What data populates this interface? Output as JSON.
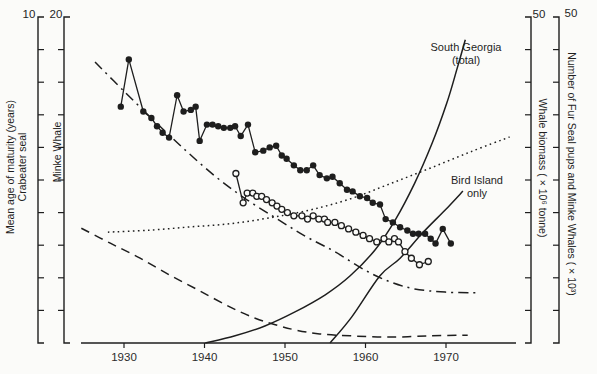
{
  "figure": {
    "ink": "#1e1e1e",
    "background": "#fbfbf9",
    "tick_text_color": "#2b2b2b"
  },
  "axes": {
    "x": {
      "tick_labels": [
        "1930",
        "1940",
        "1950",
        "1960",
        "1970"
      ],
      "tick_years": [
        1930,
        1940,
        1950,
        1960,
        1970
      ]
    },
    "left_crabeater": {
      "top_label": "10",
      "range": [
        0,
        10
      ],
      "label_line1": "Mean age of maturity (years)",
      "label_line2": "Crabeater seal"
    },
    "left_minke": {
      "top_label": "20",
      "range": [
        0,
        20
      ],
      "label": "Minke Whale"
    },
    "right_biomass": {
      "top_label": "50",
      "range": [
        0,
        50
      ],
      "label": "Whale biomass ( × 10⁶ tonne)"
    },
    "right_counts": {
      "top_label": "50",
      "range": [
        0,
        50
      ],
      "label": "Number of Fur Seal pups and Minke Whales ( × 10³)"
    }
  },
  "annotations": {
    "south_georgia": {
      "line1": "South Georgia",
      "line2": "(total)"
    },
    "bird_island": {
      "line1": "Bird Island",
      "line2": "only"
    }
  },
  "chart_data": {
    "type": "line",
    "title": "",
    "xlabel": "",
    "x_range": [
      1924,
      1980
    ],
    "grid": false,
    "series": [
      {
        "name": "minke-whale-age-at-maturity",
        "marker": "filled-circle",
        "line": "solid",
        "axis": "left_minke",
        "points": [
          [
            1929.6,
            14.5
          ],
          [
            1930.6,
            17.4
          ],
          [
            1932.4,
            14.2
          ],
          [
            1933.4,
            13.8
          ],
          [
            1934.1,
            13.3
          ],
          [
            1934.8,
            12.9
          ],
          [
            1935.6,
            12.6
          ],
          [
            1936.6,
            15.2
          ],
          [
            1937.4,
            14.2
          ],
          [
            1938.3,
            14.3
          ],
          [
            1938.9,
            14.5
          ],
          [
            1939.4,
            12.4
          ],
          [
            1940.3,
            13.4
          ],
          [
            1941.0,
            13.4
          ],
          [
            1941.7,
            13.3
          ],
          [
            1942.4,
            13.2
          ],
          [
            1943.2,
            13.2
          ],
          [
            1943.8,
            13.3
          ],
          [
            1944.5,
            12.7
          ],
          [
            1945.4,
            13.4
          ],
          [
            1946.3,
            11.7
          ],
          [
            1947.3,
            11.8
          ],
          [
            1948.1,
            12.0
          ],
          [
            1948.9,
            12.1
          ],
          [
            1949.6,
            11.5
          ],
          [
            1950.2,
            11.3
          ],
          [
            1951.1,
            10.9
          ],
          [
            1951.9,
            10.6
          ],
          [
            1952.7,
            10.6
          ],
          [
            1953.5,
            10.9
          ],
          [
            1954.3,
            10.3
          ],
          [
            1955.2,
            10.1
          ],
          [
            1955.9,
            10.2
          ],
          [
            1956.8,
            9.8
          ],
          [
            1957.7,
            9.4
          ],
          [
            1958.4,
            9.3
          ],
          [
            1959.3,
            9.0
          ],
          [
            1960.2,
            8.9
          ],
          [
            1960.9,
            8.6
          ],
          [
            1961.8,
            8.5
          ],
          [
            1962.5,
            7.6
          ],
          [
            1963.4,
            7.4
          ],
          [
            1964.3,
            7.1
          ],
          [
            1965.2,
            6.9
          ],
          [
            1965.9,
            6.7
          ],
          [
            1966.6,
            6.7
          ],
          [
            1967.4,
            6.7
          ],
          [
            1968.1,
            6.4
          ],
          [
            1968.7,
            6.1
          ],
          [
            1969.6,
            7.0
          ],
          [
            1970.6,
            6.1
          ]
        ]
      },
      {
        "name": "crabeater-seal-age-at-maturity",
        "marker": "open-circle",
        "line": "solid",
        "axis": "left_crabeater",
        "points": [
          [
            1943.9,
            5.2
          ],
          [
            1944.8,
            4.3
          ],
          [
            1945.3,
            4.6
          ],
          [
            1946.0,
            4.6
          ],
          [
            1946.5,
            4.5
          ],
          [
            1947.1,
            4.5
          ],
          [
            1947.7,
            4.4
          ],
          [
            1948.4,
            4.3
          ],
          [
            1949.0,
            4.2
          ],
          [
            1949.6,
            4.1
          ],
          [
            1950.3,
            4.0
          ],
          [
            1951.1,
            3.9
          ],
          [
            1952.1,
            3.9
          ],
          [
            1952.8,
            3.8
          ],
          [
            1953.5,
            3.9
          ],
          [
            1954.2,
            3.8
          ],
          [
            1954.9,
            3.8
          ],
          [
            1955.3,
            3.7
          ],
          [
            1956.2,
            3.7
          ],
          [
            1957.0,
            3.6
          ],
          [
            1957.9,
            3.5
          ],
          [
            1958.8,
            3.4
          ],
          [
            1959.7,
            3.3
          ],
          [
            1960.5,
            3.2
          ],
          [
            1961.4,
            3.1
          ],
          [
            1962.3,
            3.2
          ],
          [
            1962.9,
            3.1
          ],
          [
            1963.6,
            3.2
          ],
          [
            1964.1,
            3.1
          ],
          [
            1964.9,
            2.8
          ],
          [
            1965.7,
            2.6
          ],
          [
            1966.7,
            2.4
          ],
          [
            1967.8,
            2.5
          ]
        ]
      },
      {
        "name": "dash-dot-curve-whale-biomass",
        "marker": "none",
        "line": "dash-dot",
        "axis": "right_biomass",
        "points": [
          [
            1926.4,
            43.1
          ],
          [
            1930.1,
            38.5
          ],
          [
            1933.9,
            33.9
          ],
          [
            1937.6,
            29.6
          ],
          [
            1941.3,
            25.6
          ],
          [
            1945.0,
            22.2
          ],
          [
            1948.8,
            19.2
          ],
          [
            1952.5,
            16.4
          ],
          [
            1956.2,
            14.0
          ],
          [
            1959.9,
            11.2
          ],
          [
            1963.0,
            9.4
          ],
          [
            1966.1,
            8.3
          ],
          [
            1969.9,
            7.8
          ],
          [
            1974.2,
            7.7
          ]
        ]
      },
      {
        "name": "dashed-curve",
        "marker": "none",
        "line": "dashed",
        "axis": "right_biomass",
        "points": [
          [
            1924.7,
            17.6
          ],
          [
            1928.3,
            15.3
          ],
          [
            1932.0,
            13.0
          ],
          [
            1935.7,
            10.4
          ],
          [
            1939.4,
            8.0
          ],
          [
            1943.2,
            5.5
          ],
          [
            1946.3,
            3.8
          ],
          [
            1948.8,
            2.8
          ],
          [
            1951.3,
            2.0
          ],
          [
            1954.3,
            1.4
          ],
          [
            1958.1,
            1.1
          ],
          [
            1963.0,
            0.9
          ],
          [
            1968.0,
            1.1
          ],
          [
            1972.7,
            1.2
          ]
        ]
      },
      {
        "name": "dotted-curve",
        "marker": "none",
        "line": "dotted",
        "axis": "right_counts",
        "points": [
          [
            1928.0,
            17.0
          ],
          [
            1933.2,
            17.3
          ],
          [
            1938.2,
            17.8
          ],
          [
            1943.2,
            18.3
          ],
          [
            1948.1,
            19.2
          ],
          [
            1953.1,
            20.4
          ],
          [
            1958.1,
            22.1
          ],
          [
            1963.0,
            24.4
          ],
          [
            1968.0,
            26.8
          ],
          [
            1973.0,
            29.3
          ],
          [
            1977.9,
            31.6
          ]
        ]
      },
      {
        "name": "fur-seal-pups-south-georgia-total",
        "marker": "none",
        "line": "solid",
        "axis": "right_counts",
        "points": [
          [
            1940.1,
            0
          ],
          [
            1943.8,
            1.1
          ],
          [
            1947.5,
            2.6
          ],
          [
            1951.3,
            4.8
          ],
          [
            1955.0,
            7.4
          ],
          [
            1958.1,
            10.3
          ],
          [
            1961.2,
            14.3
          ],
          [
            1963.7,
            18.9
          ],
          [
            1966.1,
            24.5
          ],
          [
            1968.3,
            30.7
          ],
          [
            1970.1,
            36.8
          ],
          [
            1971.4,
            42.2
          ],
          [
            1972.4,
            46.5
          ]
        ]
      },
      {
        "name": "fur-seal-pups-bird-island-only",
        "marker": "none",
        "line": "solid",
        "axis": "right_counts",
        "points": [
          [
            1955.6,
            0
          ],
          [
            1958.3,
            4.0
          ],
          [
            1961.8,
            10.3
          ],
          [
            1964.3,
            13.0
          ],
          [
            1967.1,
            16.9
          ],
          [
            1969.9,
            20.4
          ],
          [
            1972.1,
            23.3
          ]
        ]
      }
    ]
  }
}
